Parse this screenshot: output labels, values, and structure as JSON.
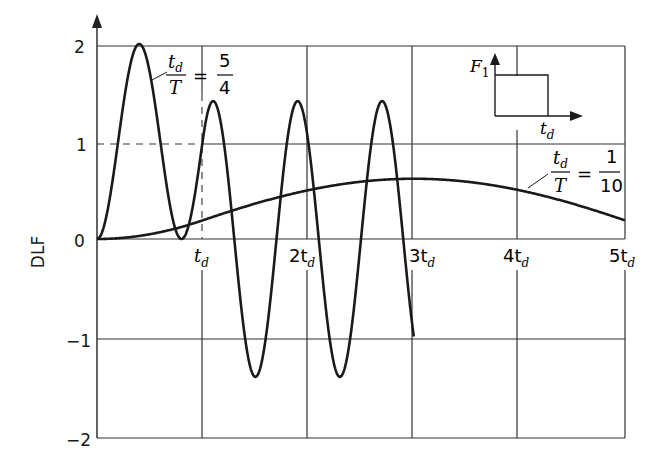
{
  "chart_data": {
    "type": "line",
    "title": "",
    "xlabel": "",
    "ylabel": "DLF",
    "xlim": [
      0,
      5
    ],
    "ylim": [
      -2,
      2
    ],
    "x_unit": "t_d",
    "x_ticks": [
      0,
      1,
      2,
      3,
      4,
      5
    ],
    "x_tick_labels": [
      "",
      "t_d",
      "2t_d",
      "3t_d",
      "4t_d",
      "5t_d"
    ],
    "y_ticks": [
      -2,
      -1,
      0,
      1,
      2
    ],
    "y_tick_labels": [
      "−2",
      "−1",
      "0",
      "1",
      "2"
    ],
    "grid": true,
    "reference_lines": [
      {
        "type": "dashed-horizontal",
        "y": 1,
        "x_range": [
          0,
          1
        ]
      },
      {
        "type": "dashed-vertical",
        "x": 1,
        "y_range": [
          0,
          1
        ]
      }
    ],
    "series": [
      {
        "name": "td/T = 5/4",
        "label_num": "t_d",
        "label_den": "T",
        "ratio_num": "5",
        "ratio_den": "4",
        "ratio": 1.25,
        "x_end": 3,
        "x": [
          0,
          0.2,
          0.4,
          0.6,
          0.8,
          1.0,
          1.1,
          1.2,
          1.4,
          1.6,
          1.8,
          2.0,
          2.2,
          2.4,
          2.6,
          2.8,
          3.0
        ],
        "values": [
          0,
          1.0,
          2.0,
          1.0,
          0,
          1.0,
          1.41,
          1.0,
          -1.0,
          -1.41,
          0,
          1.41,
          0,
          -1.41,
          0,
          1.41,
          -1.0
        ],
        "peaks": {
          "max_forced": 2.0,
          "max_free": 1.41,
          "min_free": -1.41
        }
      },
      {
        "name": "td/T = 1/10",
        "label_num": "t_d",
        "label_den": "T",
        "ratio_num": "1",
        "ratio_den": "10",
        "ratio": 0.1,
        "x_end": 5,
        "x": [
          0,
          0.5,
          1.0,
          1.5,
          2.0,
          2.5,
          3.0,
          3.5,
          4.0,
          4.5,
          5.0
        ],
        "values": [
          0,
          0.05,
          0.19,
          0.31,
          0.43,
          0.54,
          0.6,
          0.61,
          0.58,
          0.48,
          0.36
        ],
        "peaks": {
          "max": 0.62
        }
      }
    ],
    "inset": {
      "description": "Rectangular pulse load",
      "y_label": "F1",
      "x_label": "t_d"
    }
  },
  "labels": {
    "ylabel": "DLF",
    "y2": "2",
    "y1": "1",
    "y0": "0",
    "ym1": "−1",
    "ym2": "−2",
    "x1": "t",
    "x2": "2t",
    "x3": "3t",
    "x4": "4t",
    "x5": "5t",
    "sub": "d",
    "s1_num": "t",
    "s1_den": "T",
    "s1_eq": "=",
    "s1_rnum": "5",
    "s1_rden": "4",
    "s2_num": "t",
    "s2_den": "T",
    "s2_eq": "=",
    "s2_rnum": "1",
    "s2_rden": "10",
    "inset_F": "F",
    "inset_F_sub": "1",
    "inset_t": "t"
  }
}
